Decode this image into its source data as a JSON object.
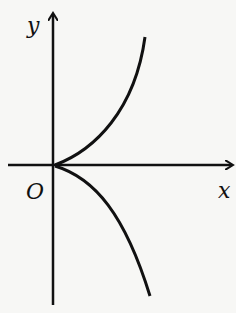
{
  "diagram": {
    "type": "coordinate-graph",
    "axes": {
      "x_label": "x",
      "y_label": "y",
      "origin_label": "O"
    },
    "curves": [
      {
        "name": "upper-branch",
        "description": "curve rising from origin into first quadrant"
      },
      {
        "name": "lower-branch",
        "description": "curve falling from origin into fourth quadrant"
      }
    ],
    "colors": {
      "stroke": "#111111",
      "background": "#f7f7f5"
    }
  }
}
